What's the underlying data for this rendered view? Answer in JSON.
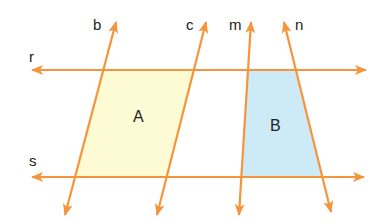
{
  "diagram": {
    "title": "",
    "colors": {
      "line": "#f5943a",
      "region_a_fill": "#fdfbd4",
      "region_b_fill": "#cdebf7",
      "text": "#222222",
      "background": "#ffffff"
    },
    "lines": [
      {
        "name": "r",
        "label": "r",
        "orientation": "horizontal"
      },
      {
        "name": "s",
        "label": "s",
        "orientation": "horizontal"
      },
      {
        "name": "b",
        "label": "b",
        "orientation": "transversal"
      },
      {
        "name": "c",
        "label": "c",
        "orientation": "transversal"
      },
      {
        "name": "m",
        "label": "m",
        "orientation": "transversal"
      },
      {
        "name": "n",
        "label": "n",
        "orientation": "transversal"
      }
    ],
    "regions": [
      {
        "name": "A",
        "label": "A",
        "shape": "parallelogram",
        "bounded_by": [
          "r",
          "s",
          "b",
          "c"
        ]
      },
      {
        "name": "B",
        "label": "B",
        "shape": "trapezoid",
        "bounded_by": [
          "r",
          "s",
          "m",
          "n"
        ]
      }
    ]
  }
}
